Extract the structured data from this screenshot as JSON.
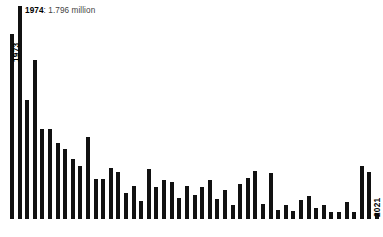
{
  "chart_data": {
    "type": "bar",
    "title": "",
    "subtitle": "",
    "xlabel": "",
    "ylabel": "",
    "grid": false,
    "legend": "none",
    "ylim": [
      0,
      1.85
    ],
    "units": "million",
    "categories": [
      "1973",
      "1974",
      "1975",
      "1976",
      "1977",
      "1978",
      "1979",
      "1980",
      "1981",
      "1982",
      "1983",
      "1984",
      "1985",
      "1986",
      "1987",
      "1988",
      "1989",
      "1990",
      "1991",
      "1992",
      "1993",
      "1994",
      "1995",
      "1996",
      "1997",
      "1998",
      "1999",
      "2000",
      "2001",
      "2002",
      "2003",
      "2004",
      "2005",
      "2006",
      "2007",
      "2008",
      "2009",
      "2010",
      "2011",
      "2012",
      "2013",
      "2014",
      "2015",
      "2016",
      "2017",
      "2018",
      "2019",
      "2020",
      "2021"
    ],
    "values": [
      1.565,
      1.796,
      1.005,
      1.345,
      0.76,
      0.76,
      0.64,
      0.595,
      0.51,
      0.448,
      0.69,
      0.335,
      0.335,
      0.435,
      0.4,
      0.22,
      0.28,
      0.15,
      0.42,
      0.27,
      0.33,
      0.31,
      0.18,
      0.275,
      0.2,
      0.27,
      0.33,
      0.17,
      0.245,
      0.12,
      0.3,
      0.35,
      0.405,
      0.13,
      0.39,
      0.075,
      0.115,
      0.065,
      0.16,
      0.195,
      0.095,
      0.12,
      0.06,
      0.06,
      0.145,
      0.06,
      0.45,
      0.395,
      0.055
    ],
    "annotations": [
      {
        "name": "peak-callout",
        "category": "1974",
        "year_label": "1974",
        "value_label": ": 1.796 million"
      }
    ],
    "axis_end_labels": {
      "start": "1973",
      "end": "2021"
    },
    "colors": {
      "bar": "#111111",
      "background": "#ffffff",
      "annotation_year": "#000000",
      "annotation_value": "#444444"
    }
  },
  "bottom_note": ""
}
